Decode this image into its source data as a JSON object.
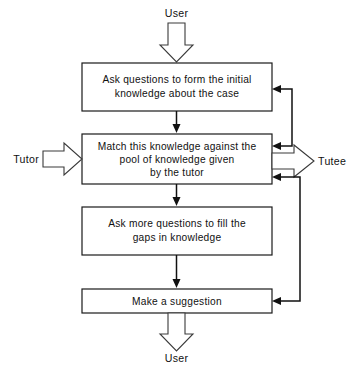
{
  "diagram": {
    "background_color": "#ffffff",
    "line_color": "#111111",
    "box_fill": "#ffffff",
    "box_stroke": "#1a1a1a"
  },
  "io_labels": {
    "top_input": "User",
    "left_input": "Tutor",
    "right_output": "Tutee",
    "bottom_output": "User"
  },
  "boxes": [
    {
      "id": "box-initial-questions",
      "lines": [
        "Ask questions to form the initial",
        "knowledge about the case"
      ]
    },
    {
      "id": "box-match-knowledge",
      "lines": [
        "Match this knowledge against the",
        "pool of knowledge given",
        "by the tutor"
      ]
    },
    {
      "id": "box-more-questions",
      "lines": [
        "Ask more questions to fill the",
        "gaps in knowledge"
      ]
    },
    {
      "id": "box-make-suggestion",
      "lines": [
        "Make a suggestion"
      ]
    }
  ],
  "connectors": [
    {
      "id": "user-in",
      "from": "User",
      "to": "box-initial-questions",
      "style": "block-arrow-down"
    },
    {
      "id": "c1-to-c2",
      "from": "box-initial-questions",
      "to": "box-match-knowledge",
      "style": "line-down"
    },
    {
      "id": "c2-to-c3",
      "from": "box-match-knowledge",
      "to": "box-more-questions",
      "style": "line-down"
    },
    {
      "id": "c3-to-c4",
      "from": "box-more-questions",
      "to": "box-make-suggestion",
      "style": "line-down"
    },
    {
      "id": "tutor-in",
      "from": "Tutor",
      "to": "box-match-knowledge",
      "style": "block-arrow-right"
    },
    {
      "id": "tutee-out",
      "from": "box-match-knowledge",
      "to": "Tutee",
      "style": "block-arrow-right"
    },
    {
      "id": "user-out",
      "from": "box-make-suggestion",
      "to": "User",
      "style": "block-arrow-down"
    },
    {
      "id": "feedback-2-1",
      "from": "box-match-knowledge",
      "to": "box-initial-questions",
      "style": "loop-right"
    },
    {
      "id": "feedback-4-2",
      "from": "box-make-suggestion",
      "to": "box-match-knowledge",
      "style": "loop-right"
    }
  ]
}
